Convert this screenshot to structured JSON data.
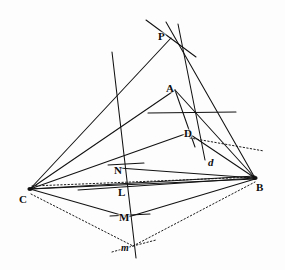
{
  "figure": {
    "background_color": "#fdfdfd",
    "ink_color": "#111111",
    "width": 285,
    "height": 270
  },
  "labels": [
    {
      "id": "P",
      "text": "P",
      "x": 158,
      "y": 31,
      "style": "bold"
    },
    {
      "id": "A",
      "text": "A",
      "x": 166,
      "y": 83,
      "style": "bold"
    },
    {
      "id": "D",
      "text": "D",
      "x": 184,
      "y": 128,
      "style": "bold"
    },
    {
      "id": "d",
      "text": "d",
      "x": 208,
      "y": 157,
      "style": "italic"
    },
    {
      "id": "N",
      "text": "N",
      "x": 114,
      "y": 165,
      "style": "bold"
    },
    {
      "id": "L",
      "text": "L",
      "x": 118,
      "y": 187,
      "style": "bold"
    },
    {
      "id": "M",
      "text": "M",
      "x": 119,
      "y": 212,
      "style": "bold"
    },
    {
      "id": "m",
      "text": "m",
      "x": 121,
      "y": 243,
      "style": "italic-small"
    },
    {
      "id": "C",
      "text": "C",
      "x": 19,
      "y": 194,
      "style": "bold"
    },
    {
      "id": "B",
      "text": "B",
      "x": 256,
      "y": 182,
      "style": "bold"
    }
  ],
  "points": {
    "P": {
      "x": 171,
      "y": 38
    },
    "A": {
      "x": 175,
      "y": 90
    },
    "D": {
      "x": 188,
      "y": 133
    },
    "d": {
      "x": 214,
      "y": 162
    },
    "N": {
      "x": 123,
      "y": 169
    },
    "L": {
      "x": 125,
      "y": 192
    },
    "M": {
      "x": 128,
      "y": 217
    },
    "m": {
      "x": 133,
      "y": 246
    },
    "C": {
      "x": 30,
      "y": 189
    },
    "B": {
      "x": 255,
      "y": 178
    }
  },
  "solid_segments": [
    {
      "name": "edge-C-P",
      "x1": 30,
      "y1": 189,
      "x2": 171,
      "y2": 38
    },
    {
      "name": "edge-C-A",
      "x1": 30,
      "y1": 189,
      "x2": 175,
      "y2": 90
    },
    {
      "name": "edge-C-D",
      "x1": 30,
      "y1": 189,
      "x2": 188,
      "y2": 133
    },
    {
      "name": "edge-C-N",
      "x1": 30,
      "y1": 189,
      "x2": 255,
      "y2": 176
    },
    {
      "name": "edge-C-B",
      "x1": 30,
      "y1": 189,
      "x2": 255,
      "y2": 179
    },
    {
      "name": "edge-C-M-B",
      "x1": 30,
      "y1": 189,
      "x2": 128,
      "y2": 217
    },
    {
      "name": "edge-M-B",
      "x1": 128,
      "y1": 217,
      "x2": 255,
      "y2": 179
    },
    {
      "name": "edge-B-P-upper",
      "x1": 255,
      "y1": 178,
      "x2": 166,
      "y2": 22
    },
    {
      "name": "edge-B-A",
      "x1": 255,
      "y1": 178,
      "x2": 175,
      "y2": 90
    },
    {
      "name": "edge-B-D",
      "x1": 255,
      "y1": 178,
      "x2": 188,
      "y2": 133
    },
    {
      "name": "edge-B-N",
      "x1": 255,
      "y1": 178,
      "x2": 119,
      "y2": 168
    },
    {
      "name": "edge-B-L",
      "x1": 255,
      "y1": 178,
      "x2": 78,
      "y2": 190
    },
    {
      "name": "edge-A-D-curve",
      "x1": 175,
      "y1": 90,
      "x2": 195,
      "y2": 147
    },
    {
      "name": "line-P-down-right",
      "x1": 178,
      "y1": 24,
      "x2": 205,
      "y2": 160
    },
    {
      "name": "line-through-P-left",
      "x1": 146,
      "y1": 20,
      "x2": 196,
      "y2": 57
    },
    {
      "name": "long-slant-NLMm",
      "x1": 112,
      "y1": 52,
      "x2": 136,
      "y2": 258
    },
    {
      "name": "line-D-extend-right",
      "x1": 148,
      "y1": 113,
      "x2": 236,
      "y2": 112
    },
    {
      "name": "tick-N",
      "x1": 108,
      "y1": 165,
      "x2": 144,
      "y2": 163
    },
    {
      "name": "tick-M",
      "x1": 110,
      "y1": 216,
      "x2": 150,
      "y2": 214
    }
  ],
  "dotted_segments": [
    {
      "name": "dotted-C-d-B",
      "x1": 32,
      "y1": 186,
      "x2": 255,
      "y2": 177
    },
    {
      "name": "dotted-C-m",
      "x1": 31,
      "y1": 194,
      "x2": 133,
      "y2": 246
    },
    {
      "name": "dotted-m-B",
      "x1": 133,
      "y1": 246,
      "x2": 255,
      "y2": 182
    },
    {
      "name": "dotted-D-right",
      "x1": 190,
      "y1": 138,
      "x2": 264,
      "y2": 151
    },
    {
      "name": "dotted-m-tick-left",
      "x1": 112,
      "y1": 252,
      "x2": 133,
      "y2": 246
    },
    {
      "name": "dotted-m-tick-right",
      "x1": 133,
      "y1": 246,
      "x2": 156,
      "y2": 240
    }
  ]
}
